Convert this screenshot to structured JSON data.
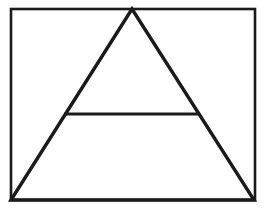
{
  "figure": {
    "title": "Triangle inscribed in rectangle with horizontal crossbar",
    "background_color": "#ffffff",
    "stroke_color": "#1a1a1a",
    "canvas": {
      "width": 273,
      "height": 211
    },
    "shapes": [
      {
        "name": "outer-rectangle",
        "type": "rect",
        "x": 11,
        "y": 9,
        "width": 244,
        "height": 191,
        "stroke_width": 2.6,
        "fill": "none"
      },
      {
        "name": "triangle",
        "type": "polygon",
        "points": "11,200 132,9 254,200",
        "stroke_width": 3.4,
        "fill": "none",
        "vertices": {
          "apex": [
            132,
            9
          ],
          "bottom_left": [
            11,
            200
          ],
          "bottom_right": [
            254,
            200
          ]
        }
      },
      {
        "name": "crossbar",
        "type": "line",
        "x1": 64,
        "y1": 114,
        "x2": 198,
        "y2": 114,
        "stroke_width": 3.2
      }
    ]
  }
}
